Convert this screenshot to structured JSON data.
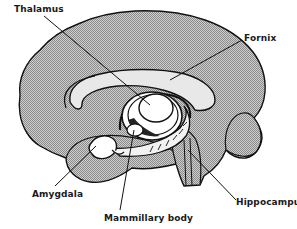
{
  "diagram": {
    "type": "anatomical-line-drawing",
    "colors": {
      "outline": "#111111",
      "shading": "#bdbdbd",
      "highlight": "#ffffff",
      "background": "#ffffff"
    },
    "labels": [
      {
        "id": "thalamus",
        "text": "Thalamus",
        "x": 14,
        "y": 4
      },
      {
        "id": "fornix",
        "text": "Fornix",
        "x": 244,
        "y": 33
      },
      {
        "id": "amygdala",
        "text": "Amygdala",
        "x": 32,
        "y": 189
      },
      {
        "id": "mammillary-body",
        "text": "Mammillary body",
        "x": 104,
        "y": 213
      },
      {
        "id": "hippocampus",
        "text": "Hippocampus",
        "x": 236,
        "y": 197
      }
    ]
  }
}
